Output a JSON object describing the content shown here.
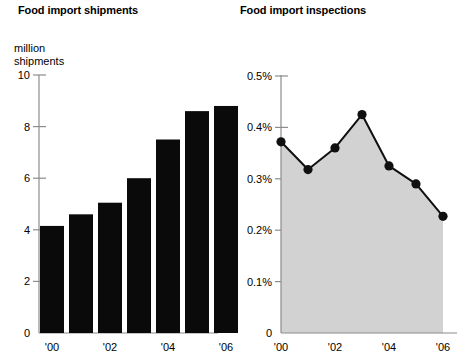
{
  "charts": {
    "shipments": {
      "title": "Food import shipments",
      "unit_label": "million\nshipments"
    },
    "inspections": {
      "title": "Food import inspections",
      "annotation": "Samples analyzed\nin a laboratory as a\npercentage of\nimport shipments"
    }
  },
  "chart_data": [
    {
      "type": "bar",
      "title": "Food import shipments",
      "xlabel": "",
      "ylabel": "million shipments",
      "categories": [
        "'00",
        "'01",
        "'02",
        "'03",
        "'04",
        "'05",
        "'06"
      ],
      "tick_labels_x": [
        "'00",
        "'02",
        "'04",
        "'06"
      ],
      "tick_labels_y": [
        "0",
        "2",
        "4",
        "6",
        "8",
        "10"
      ],
      "ticks_y": [
        0,
        2,
        4,
        6,
        8,
        10
      ],
      "values": [
        4.15,
        4.6,
        5.05,
        6.0,
        7.5,
        8.6,
        8.8
      ],
      "ylim": [
        0,
        10
      ],
      "grid": false,
      "legend": "none",
      "bar_color": "#0a0a0a"
    },
    {
      "type": "area",
      "title": "Food import inspections",
      "xlabel": "",
      "ylabel": "",
      "categories": [
        "'00",
        "'01",
        "'02",
        "'03",
        "'04",
        "'05",
        "'06"
      ],
      "tick_labels_x": [
        "'00",
        "'02",
        "'04",
        "'06"
      ],
      "tick_labels_y": [
        "0",
        "0.1%",
        "0.2%",
        "0.3%",
        "0.4%",
        "0.5%"
      ],
      "ticks_y": [
        0,
        0.1,
        0.2,
        0.3,
        0.4,
        0.5
      ],
      "values": [
        0.372,
        0.318,
        0.36,
        0.425,
        0.325,
        0.29,
        0.227
      ],
      "ylim": [
        0,
        0.5
      ],
      "grid": false,
      "legend": "none",
      "annotation": "Samples analyzed in a laboratory as a percentage of import shipments",
      "fill_color": "#d2d2d2",
      "line_color": "#101010",
      "marker_color": "#101010"
    }
  ]
}
